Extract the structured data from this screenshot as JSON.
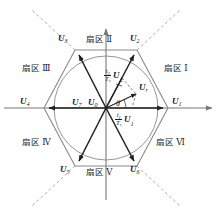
{
  "figure": {
    "width": 216,
    "height": 217,
    "background": "#ffffff",
    "line_color": "#808080",
    "bold_line_color": "#1a1a1a",
    "text_color": "#1a1a1a"
  },
  "axes": {
    "horizontal_label": "",
    "vertical_label": "",
    "origin": {
      "x": 106,
      "y": 108
    }
  },
  "sectors": [
    {
      "id": "sector-1",
      "label": "扇区 Ⅰ",
      "x": 166,
      "y": 68
    },
    {
      "id": "sector-2",
      "label": "扇区 Ⅱ",
      "x": 88,
      "y": 39
    },
    {
      "id": "sector-3",
      "label": "扇区 Ⅲ",
      "x": 26,
      "y": 68
    },
    {
      "id": "sector-4",
      "label": "扇区 Ⅳ",
      "x": 26,
      "y": 142
    },
    {
      "id": "sector-5",
      "label": "扇区 Ⅴ",
      "x": 88,
      "y": 172
    },
    {
      "id": "sector-6",
      "label": "扇区 Ⅵ",
      "x": 160,
      "y": 142
    }
  ],
  "vectors": [
    {
      "id": "u1",
      "symbol": "U",
      "sub": "1",
      "x": 172,
      "y": 101,
      "vertex": {
        "x": 168,
        "y": 108
      }
    },
    {
      "id": "u2",
      "symbol": "U",
      "sub": "2",
      "x": 131,
      "y": 38,
      "vertex": {
        "x": 137,
        "y": 50
      }
    },
    {
      "id": "u3",
      "symbol": "U",
      "sub": "3",
      "x": 61,
      "y": 38,
      "vertex": {
        "x": 75,
        "y": 50
      }
    },
    {
      "id": "u4",
      "symbol": "U",
      "sub": "4",
      "x": 21,
      "y": 101,
      "vertex": {
        "x": 44,
        "y": 108
      }
    },
    {
      "id": "u5",
      "symbol": "U",
      "sub": "5",
      "x": 62,
      "y": 168,
      "vertex": {
        "x": 75,
        "y": 166
      }
    },
    {
      "id": "u6",
      "symbol": "U",
      "sub": "6",
      "x": 131,
      "y": 168,
      "vertex": {
        "x": 137,
        "y": 166
      }
    }
  ],
  "zero_vectors": [
    {
      "id": "u7",
      "symbol": "U",
      "sub": "7",
      "x": 74,
      "y": 101
    },
    {
      "id": "u0",
      "symbol": "U",
      "sub": "0",
      "x": 90,
      "y": 101
    }
  ],
  "reference_vector": {
    "id": "ur",
    "symbol": "U",
    "sub": "r",
    "label_x": 141,
    "label_y": 85,
    "tip": {
      "x": 139,
      "y": 93
    },
    "angle_label": "θ",
    "angle_label_x": 117,
    "angle_label_y": 104,
    "angle_degrees": 20
  },
  "components": [
    {
      "id": "component-u2",
      "numerator": "t",
      "numerator_sub": "2",
      "denominator": "T",
      "denominator_sub": "s",
      "vector": "U",
      "vector_sub": "2",
      "x": 107,
      "y": 71
    },
    {
      "id": "component-u1",
      "numerator": "t",
      "numerator_sub": "1",
      "denominator": "T",
      "denominator_sub": "s",
      "vector": "U",
      "vector_sub": "1",
      "x": 118,
      "y": 115
    }
  ],
  "circle": {
    "id": "inscribed-circle",
    "cx": 106,
    "cy": 108,
    "r": 52
  }
}
